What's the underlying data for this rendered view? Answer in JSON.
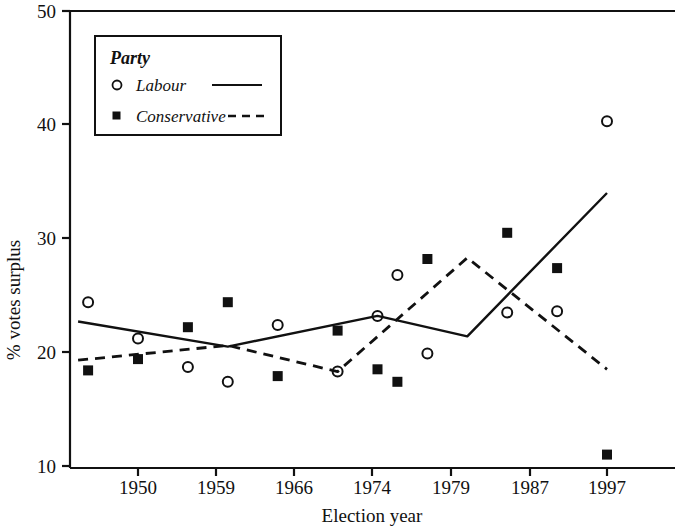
{
  "chart_data": {
    "type": "scatter",
    "title": "",
    "xlabel": "Election year",
    "ylabel": "% votes surplus",
    "xtick_labels": [
      "1950",
      "1959",
      "1966",
      "1974",
      "1979",
      "1987",
      "1997"
    ],
    "xtick_values": [
      1950,
      1959,
      1966,
      1974,
      1979,
      1987,
      1997
    ],
    "ytick_labels": [
      "10",
      "20",
      "30",
      "40",
      "50"
    ],
    "ytick_values": [
      10,
      20,
      30,
      40,
      50
    ],
    "ylim": [
      10,
      50
    ],
    "grid": false,
    "legend_position": "top-left",
    "legend_title": "Party",
    "series": [
      {
        "name": "Labour",
        "marker": "open-circle",
        "line_style": "solid",
        "points": [
          {
            "x": 1945,
            "y": 24.4
          },
          {
            "x": 1950,
            "y": 21.2
          },
          {
            "x": 1955,
            "y": 18.7
          },
          {
            "x": 1959,
            "y": 17.4
          },
          {
            "x": 1964,
            "y": 22.4
          },
          {
            "x": 1970,
            "y": 18.3
          },
          {
            "x": 1974,
            "y": 23.2
          },
          {
            "x": 1976,
            "y": 26.8
          },
          {
            "x": 1979,
            "y": 19.9
          },
          {
            "x": 1987,
            "y": 23.5
          },
          {
            "x": 1992,
            "y": 23.6
          },
          {
            "x": 1997,
            "y": 40.3
          }
        ],
        "smoothed_line": [
          {
            "x": 1944,
            "y": 22.7
          },
          {
            "x": 1959,
            "y": 20.5
          },
          {
            "x": 1974,
            "y": 23.2
          },
          {
            "x": 1983,
            "y": 21.4
          },
          {
            "x": 1997,
            "y": 34.0
          }
        ]
      },
      {
        "name": "Conservative",
        "marker": "filled-square",
        "line_style": "dashed",
        "points": [
          {
            "x": 1945,
            "y": 18.4
          },
          {
            "x": 1950,
            "y": 19.4
          },
          {
            "x": 1955,
            "y": 22.2
          },
          {
            "x": 1959,
            "y": 24.4
          },
          {
            "x": 1964,
            "y": 17.9
          },
          {
            "x": 1970,
            "y": 21.9
          },
          {
            "x": 1974,
            "y": 18.5
          },
          {
            "x": 1976,
            "y": 17.4
          },
          {
            "x": 1979,
            "y": 28.2
          },
          {
            "x": 1987,
            "y": 30.5
          },
          {
            "x": 1992,
            "y": 27.4
          },
          {
            "x": 1997,
            "y": 11.0
          }
        ],
        "smoothed_line": [
          {
            "x": 1944,
            "y": 19.3
          },
          {
            "x": 1959,
            "y": 20.6
          },
          {
            "x": 1970,
            "y": 18.3
          },
          {
            "x": 1983,
            "y": 28.3
          },
          {
            "x": 1997,
            "y": 18.5
          }
        ]
      }
    ]
  },
  "legend": {
    "title": "Party",
    "entries": [
      {
        "label": "Labour",
        "marker": "open-circle",
        "line": "solid"
      },
      {
        "label": "Conservative",
        "marker": "filled-square",
        "line": "dashed"
      }
    ]
  },
  "axes": {
    "x_title": "Election year",
    "y_title": "% votes surplus",
    "y_labels": [
      "50",
      "40",
      "30",
      "20",
      "10"
    ],
    "x_labels": [
      "1950",
      "1959",
      "1966",
      "1974",
      "1979",
      "1987",
      "1997"
    ]
  },
  "colors": {
    "line": "#111111",
    "background": "#ffffff",
    "marker_fill": "#111111"
  }
}
